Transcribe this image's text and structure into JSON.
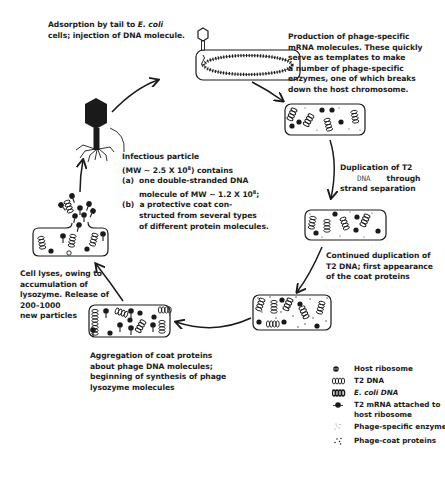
{
  "figure": {
    "steps": [
      {
        "id": "adsorption",
        "lines": [
          "Adsorption by tail to ",
          "E. coli",
          "cells; injection of DNA molecule."
        ]
      },
      {
        "id": "mrna-production",
        "lines": [
          "Production of phage-specific",
          "mRNA molecules.  These quickly",
          "serve as templates to make",
          "a number of phage-specific",
          "enzymes, one of which breaks",
          "down the host chromosome."
        ]
      },
      {
        "id": "duplication",
        "lines": [
          "Duplication of T2",
          "DNA",
          "through",
          "strand separation"
        ]
      },
      {
        "id": "continued-duplication",
        "lines": [
          "Continued duplication of",
          "T2 DNA; first appearance",
          "of the coat proteins"
        ]
      },
      {
        "id": "aggregation",
        "lines": [
          "Aggregation of coat proteins",
          "about phage DNA molecules;",
          "beginning of synthesis of phage",
          "lysozyme molecules"
        ]
      },
      {
        "id": "lysis",
        "lines": [
          "Cell lyses, owing to",
          "accumulation of",
          "lysozyme. Release of",
          "200–1000",
          "new particles"
        ]
      }
    ],
    "infectious_particle": {
      "line1": "Infectious particle",
      "line2_a": "(MW ∼ 2.5 X 10",
      "line2_exp": "8",
      "line2_b": ") contains",
      "a_label": "(a)",
      "a_line1": "one double-stranded DNA",
      "a_line2_a": "molecule of MW ∼ 1.2 X 10",
      "a_line2_exp": "8",
      "a_line2_b": ";",
      "b_label": "(b)",
      "b_line1": "a protective coat con-",
      "b_line2": "structed from several types",
      "b_line3": "of different protein molecules."
    }
  },
  "legend": {
    "items": [
      {
        "symbol": "host-ribosome-icon",
        "label": "Host ribosome",
        "italic": false
      },
      {
        "symbol": "t2-dna-icon",
        "label": "T2 DNA",
        "italic": false
      },
      {
        "symbol": "ecoli-dna-icon",
        "label": "E. coli DNA",
        "italic": true
      },
      {
        "symbol": "t2-mrna-ribosome-icon",
        "label": "T2 mRNA attached to",
        "label2": "host ribosome",
        "italic": false
      },
      {
        "symbol": "phage-enzymes-icon",
        "label": "Phage-specific enzymes",
        "italic": false
      },
      {
        "symbol": "phage-coat-proteins-icon",
        "label": "Phage-coat proteins",
        "italic": false
      }
    ]
  },
  "colors": {
    "ink": "#1a1a1a",
    "background": "#ffffff"
  }
}
